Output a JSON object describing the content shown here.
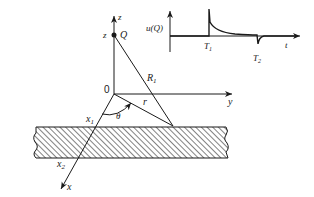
{
  "diagram": {
    "axes": {
      "z_label": "z",
      "y_label": "y",
      "x_label": "x",
      "origin_label": "0"
    },
    "points": {
      "source_label": "Q",
      "source_height_label": "z"
    },
    "segments": {
      "slant_distance_label": "R",
      "slant_distance_subscript": "1",
      "horizontal_distance_label": "r",
      "angle_label": "θ"
    },
    "boundary": {
      "x1_label": "x",
      "x1_subscript": "1",
      "x2_label": "x",
      "x2_subscript": "2"
    },
    "inset_plot": {
      "ylabel": "u(Q)",
      "xlabel": "t",
      "t1_label": "T",
      "t1_subscript": "1",
      "t2_label": "T",
      "t2_subscript": "2"
    }
  },
  "colors": {
    "ink": "#1a1a1a",
    "background": "#ffffff"
  }
}
